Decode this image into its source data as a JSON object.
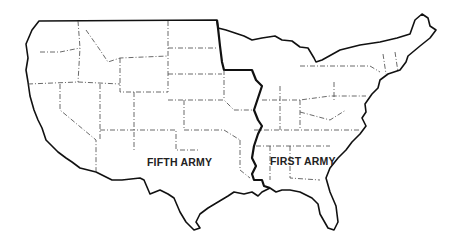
{
  "map": {
    "title": "",
    "region": "Continental United States",
    "regions": [
      {
        "label": "FIFTH ARMY",
        "side": "west"
      },
      {
        "label": "FIRST ARMY",
        "side": "east"
      }
    ],
    "colors": {
      "background": "#ffffff",
      "line": "#111111"
    }
  }
}
